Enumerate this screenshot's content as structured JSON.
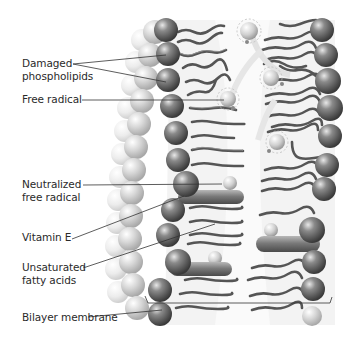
{
  "figure": {
    "labels": [
      {
        "id": "damaged-phospholipids",
        "line1": "Damaged",
        "line2": "phospholipids",
        "x": 22,
        "y": 57
      },
      {
        "id": "free-radical",
        "line1": "Free radical",
        "line2": "",
        "x": 22,
        "y": 93
      },
      {
        "id": "neutralized-free-radical",
        "line1": "Neutralized",
        "line2": "free radical",
        "x": 22,
        "y": 180
      },
      {
        "id": "vitamin-e",
        "line1": "Vitamin E",
        "line2": "",
        "x": 22,
        "y": 230
      },
      {
        "id": "unsaturated-fatty-acids",
        "line1": "Unsaturated",
        "line2": "fatty acids",
        "x": 22,
        "y": 261
      },
      {
        "id": "bilayer-membrane",
        "line1": "Bilayer membrane",
        "line2": "",
        "x": 22,
        "y": 311
      }
    ],
    "colors": {
      "head_dark": "#4a4a4a",
      "head_light": "#bdbdbd",
      "tail": "#555555",
      "tail_highlight": "#9a9a9a",
      "radical": "#cfcfcf",
      "leader_line": "#333333",
      "text": "#2a2a2a"
    }
  }
}
